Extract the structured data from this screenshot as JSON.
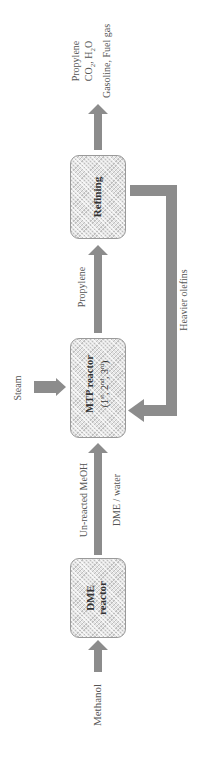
{
  "diagram": {
    "colors": {
      "arrow": "#8c8c8c",
      "box_border": "#9a9a9a",
      "box_fill": "#e4e4e4",
      "text": "#555555"
    },
    "nodes": {
      "dme_reactor": {
        "line1": "DME",
        "line2": "reactor"
      },
      "mtp_reactor": {
        "line1": "MTP reactor",
        "line2_base1": "(1",
        "sup1": "st",
        "sep1": ", 2",
        "sup2": "nd",
        "sep2": ", 3",
        "sup3": "rd",
        "end": ")"
      },
      "refining": {
        "label": "Refining"
      }
    },
    "inputs": {
      "methanol": "Methanol",
      "steam": "Steam"
    },
    "flows": {
      "dme_to_mtp_top": "Un-reacted MeOH",
      "dme_to_mtp_bottom": "DME / water",
      "mtp_to_refining": "Propylene",
      "recycle": "Heavier olefins"
    },
    "outputs": {
      "line1": "Propylene",
      "line2_pre": "CO",
      "line2_sub1": "2",
      "line2_mid": ", H",
      "line2_sub2": "2",
      "line2_post": "O",
      "line3": "Gasoline, Fuel gas"
    }
  }
}
